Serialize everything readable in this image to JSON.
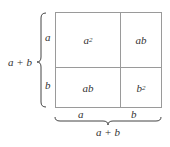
{
  "diagram": {
    "cells": {
      "top_left": {
        "base": "a",
        "exp": "2"
      },
      "top_right": "ab",
      "bottom_left": "ab",
      "bottom_right": {
        "base": "b",
        "exp": "2"
      }
    },
    "left_labels": {
      "top": "a",
      "bottom": "b",
      "total": "a + b"
    },
    "bottom_labels": {
      "left": "a",
      "right": "b",
      "total": "a + b"
    },
    "colors": {
      "line": "#9a9a9a",
      "text": "#333333"
    }
  }
}
